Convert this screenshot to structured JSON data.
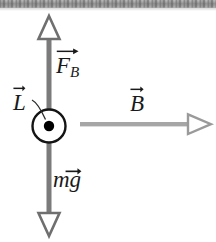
{
  "figure": {
    "background_color": "#ffffff",
    "width": 216,
    "height": 242
  },
  "colors": {
    "vertical_arrow": "#7b7b7b",
    "horizontal_arrow": "#a6a6a6",
    "arrowhead_stroke": "#6f6f6f",
    "arrowhead_fill": "#ffffff",
    "conductor_outline": "#141414",
    "conductor_fill": "#ffffff",
    "current_dot": "#000000",
    "label_text": "#1a1a1a",
    "scan_strip": "#6e6e6e"
  },
  "labels": {
    "force_magnetic": {
      "base": "F",
      "subscript": "B",
      "vector_arrow": true,
      "name": "F_B"
    },
    "length_vector": {
      "base": "L",
      "subscript": "",
      "vector_arrow": true,
      "name": "L"
    },
    "magnetic_field": {
      "base": "B",
      "subscript": "",
      "vector_arrow": true,
      "name": "B"
    },
    "weight": {
      "base": "mg",
      "arrow_over": "g",
      "vector_arrow": true,
      "name": "mg"
    }
  },
  "elements": {
    "vertical_axis": {
      "name": "vertical-double-arrow",
      "x": 49,
      "top_y": 16,
      "bottom_y": 236,
      "shaft_width": 5,
      "arrowheads": [
        "up",
        "down"
      ]
    },
    "horizontal_axis": {
      "name": "magnetic-field-arrow",
      "y": 124,
      "start_x": 80,
      "end_x": 212,
      "shaft_width": 4,
      "arrowheads": [
        "right"
      ]
    },
    "conductor": {
      "name": "current-out-of-page-symbol",
      "cx": 49,
      "cy": 126,
      "radius": 17,
      "dot_radius": 5,
      "meaning": "current out of page"
    },
    "leader_line": {
      "name": "length-label-leader",
      "from_x": 33,
      "from_y": 101,
      "to_x": 45,
      "to_y": 120
    }
  }
}
